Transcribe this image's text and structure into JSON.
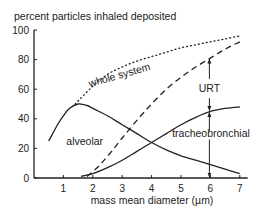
{
  "chart_data": {
    "type": "line",
    "title": "",
    "ylabel": "percent particles inhaled deposited",
    "xlabel": "mass mean diameter  (µm)",
    "xlim": [
      0,
      7.2
    ],
    "ylim": [
      0,
      100
    ],
    "xticks": [
      1,
      2,
      3,
      4,
      5,
      6,
      7
    ],
    "yticks": [
      0,
      20,
      40,
      60,
      80,
      100
    ],
    "grid": false,
    "legend": "none (inline labels)",
    "series": [
      {
        "name": "whole system",
        "style": "dotted",
        "x": [
          1.4,
          2.0,
          2.5,
          3.0,
          3.5,
          4.0,
          4.5,
          5.0,
          5.5,
          6.0,
          6.5,
          7.0
        ],
        "y": [
          50,
          62,
          70,
          75,
          79,
          82,
          85,
          88,
          90,
          92,
          94,
          96
        ]
      },
      {
        "name": "upper respiratory tract (total minus lower)",
        "style": "dashed",
        "x": [
          1.8,
          2.2,
          2.6,
          3.0,
          3.5,
          4.0,
          4.5,
          5.0,
          5.5,
          6.0,
          6.5,
          7.0
        ],
        "y": [
          1,
          8,
          17,
          27,
          39,
          50,
          60,
          68,
          75,
          81,
          87,
          92
        ]
      },
      {
        "name": "alveolar",
        "style": "solid",
        "x": [
          0.5,
          0.8,
          1.0,
          1.2,
          1.5,
          1.8,
          2.0,
          2.5,
          3.0,
          3.5,
          4.0,
          4.5,
          5.0,
          5.5,
          6.0,
          6.5,
          7.0
        ],
        "y": [
          25,
          36,
          42,
          47,
          50,
          49,
          47,
          42,
          36,
          30,
          24,
          19,
          15,
          12,
          9,
          6,
          3
        ]
      },
      {
        "name": "tracheobronchial",
        "style": "solid",
        "x": [
          1.6,
          2.0,
          2.5,
          3.0,
          3.5,
          4.0,
          4.5,
          5.0,
          5.5,
          6.0,
          6.5,
          7.0
        ],
        "y": [
          1,
          3,
          7,
          12,
          18,
          24,
          30,
          36,
          41,
          45,
          47,
          48
        ]
      }
    ],
    "annotations": [
      {
        "text": "whole system",
        "near_series": "whole system",
        "x": 2.3
      },
      {
        "text": "URT",
        "x": 6.0,
        "between": [
          "dashed",
          "tracheobronchial"
        ],
        "arrow": "double"
      },
      {
        "text": "alveolar",
        "x": 1.8,
        "y": 22
      },
      {
        "text": "tracheobronchial",
        "x": 6.0,
        "y": 30
      },
      {
        "text": "",
        "x": 6.0,
        "between": [
          "tracheobronchial",
          "x-axis"
        ],
        "arrow": "double"
      }
    ]
  }
}
